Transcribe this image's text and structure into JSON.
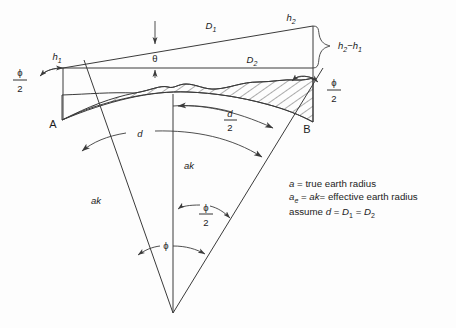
{
  "diagram": {
    "background_color": "#fdfdfd",
    "line_color": "#3b3b3b",
    "text_color": "#1c1c1c",
    "points": {
      "a_label": "A",
      "b_label": "B"
    },
    "heights": {
      "h1": "h",
      "h1_sub": "1",
      "h2": "h",
      "h2_sub": "2",
      "height_difference_main": "h",
      "height_difference_sub1": "2",
      "height_difference_minus": "−",
      "height_difference_main2": "h",
      "height_difference_sub2": "1"
    },
    "distances": {
      "d1": "D",
      "d1_sub": "1",
      "d2": "D",
      "d2_sub": "2",
      "d_arc": "d",
      "d_half_num": "d",
      "d_half_den": "2"
    },
    "angles": {
      "theta": "θ",
      "phi": "ϕ",
      "phi_half_num": "ϕ",
      "phi_half_den": "2"
    },
    "radii": {
      "ak_left": "ak",
      "ak_center": "ak"
    },
    "legend": {
      "line1_var": "a",
      "line1_text": " = true earth radius",
      "line2_var": "a",
      "line2_sub": "e",
      "line2_mid": " = ",
      "line2_var2": "ak",
      "line2_text": "= effective earth radius",
      "line3_pre": "assume ",
      "line3_d": "d",
      "line3_eq1": " = ",
      "line3_D1": "D",
      "line3_D1sub": "1",
      "line3_eq2": " = ",
      "line3_D2": "D",
      "line3_D2sub": "2"
    }
  }
}
